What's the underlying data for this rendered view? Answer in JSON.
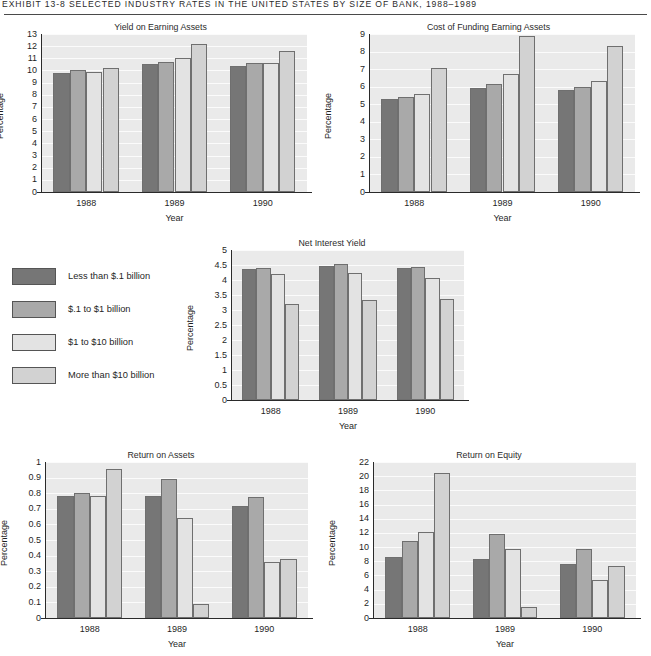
{
  "exhibit": {
    "header": "EXHIBIT 13-8   SELECTED INDUSTRY RATES IN THE UNITED STATES BY SIZE OF BANK, 1988–1989"
  },
  "legend": {
    "name": "bank-size-legend",
    "items": [
      {
        "label": "Less than $.1 billion",
        "color": "#767676"
      },
      {
        "label": "$.1 to $1 billion",
        "color": "#a9a9a9"
      },
      {
        "label": "$1 to $10 billion",
        "color": "#e3e3e3"
      },
      {
        "label": "More than $10 billion",
        "color": "#d2d2d2"
      }
    ]
  },
  "series_colors": [
    "#767676",
    "#a9a9a9",
    "#e3e3e3",
    "#d2d2d2"
  ],
  "chart_data": [
    {
      "id": "yield-on-earning-assets",
      "type": "bar",
      "title": "Yield on Earning Assets",
      "xlabel": "Year",
      "ylabel": "Percentage",
      "categories": [
        "1988",
        "1989",
        "1990"
      ],
      "ylim": [
        0,
        13
      ],
      "yticks": [
        0,
        1,
        2,
        3,
        4,
        5,
        6,
        7,
        8,
        9,
        10,
        11,
        12,
        13
      ],
      "ytick_labels": [
        "0",
        "1",
        "2",
        "3",
        "4",
        "5",
        "6",
        "7",
        "8",
        "9",
        "10",
        "11",
        "12",
        "13"
      ],
      "grid": true,
      "legend_position": "external-left-middle",
      "series": [
        {
          "name": "Less than $.1 billion",
          "values": [
            9.8,
            10.5,
            10.4
          ]
        },
        {
          "name": "$.1 to $1 billion",
          "values": [
            10.0,
            10.7,
            10.6
          ]
        },
        {
          "name": "$1 to $10 billion",
          "values": [
            9.9,
            11.0,
            10.6
          ]
        },
        {
          "name": "More than $10 billion",
          "values": [
            10.2,
            12.2,
            11.6
          ]
        }
      ]
    },
    {
      "id": "cost-of-funding-earning-assets",
      "type": "bar",
      "title": "Cost of Funding Earning Assets",
      "xlabel": "Year",
      "ylabel": "Percentage",
      "categories": [
        "1988",
        "1989",
        "1990"
      ],
      "ylim": [
        0,
        9
      ],
      "yticks": [
        0,
        1,
        2,
        3,
        4,
        5,
        6,
        7,
        8,
        9
      ],
      "ytick_labels": [
        "0",
        "1",
        "2",
        "3",
        "4",
        "5",
        "6",
        "7",
        "8",
        "9"
      ],
      "grid": true,
      "series": [
        {
          "name": "Less than $.1 billion",
          "values": [
            5.3,
            5.95,
            5.8
          ]
        },
        {
          "name": "$.1 to $1 billion",
          "values": [
            5.4,
            6.15,
            6.0
          ]
        },
        {
          "name": "$1 to $10 billion",
          "values": [
            5.6,
            6.7,
            6.35
          ]
        },
        {
          "name": "More than $10 billion",
          "values": [
            7.05,
            8.9,
            8.3
          ]
        }
      ]
    },
    {
      "id": "net-interest-yield",
      "type": "bar",
      "title": "Net Interest Yield",
      "xlabel": "Year",
      "ylabel": "Percentage",
      "categories": [
        "1988",
        "1989",
        "1990"
      ],
      "ylim": [
        0,
        5
      ],
      "yticks": [
        0,
        0.5,
        1,
        1.5,
        2,
        2.5,
        3,
        3.5,
        4,
        4.5,
        5
      ],
      "ytick_labels": [
        "0",
        "0.5",
        "1",
        "1.5",
        "2",
        "2.5",
        "3",
        "3.5",
        "4",
        "4.5",
        "5"
      ],
      "grid": true,
      "series": [
        {
          "name": "Less than $.1 billion",
          "values": [
            4.38,
            4.47,
            4.4
          ]
        },
        {
          "name": "$.1 to $1 billion",
          "values": [
            4.4,
            4.55,
            4.45
          ]
        },
        {
          "name": "$1 to $10 billion",
          "values": [
            4.2,
            4.25,
            4.08
          ]
        },
        {
          "name": "More than $10 billion",
          "values": [
            3.2,
            3.35,
            3.37
          ]
        }
      ]
    },
    {
      "id": "return-on-assets",
      "type": "bar",
      "title": "Return on Assets",
      "xlabel": "Year",
      "ylabel": "Percentage",
      "categories": [
        "1988",
        "1989",
        "1990"
      ],
      "ylim": [
        0,
        1
      ],
      "yticks": [
        0,
        0.1,
        0.2,
        0.3,
        0.4,
        0.5,
        0.6,
        0.7,
        0.8,
        0.9,
        1
      ],
      "ytick_labels": [
        "0",
        "0.1",
        "0.2",
        "0.3",
        "0.4",
        "0.5",
        "0.6",
        "0.7",
        "0.8",
        "0.9",
        "1"
      ],
      "grid": true,
      "series": [
        {
          "name": "Less than $.1 billion",
          "values": [
            0.78,
            0.78,
            0.715
          ]
        },
        {
          "name": "$.1 to $1 billion",
          "values": [
            0.8,
            0.89,
            0.775
          ]
        },
        {
          "name": "$1 to $10 billion",
          "values": [
            0.78,
            0.64,
            0.36
          ]
        },
        {
          "name": "More than $10 billion",
          "values": [
            0.955,
            0.09,
            0.38
          ]
        }
      ]
    },
    {
      "id": "return-on-equity",
      "type": "bar",
      "title": "Return on Equity",
      "xlabel": "Year",
      "ylabel": "Percentage",
      "categories": [
        "1988",
        "1989",
        "1990"
      ],
      "ylim": [
        0,
        22
      ],
      "yticks": [
        0,
        2,
        4,
        6,
        8,
        10,
        12,
        14,
        16,
        18,
        20,
        22
      ],
      "ytick_labels": [
        "0",
        "2",
        "4",
        "6",
        "8",
        "10",
        "12",
        "14",
        "16",
        "18",
        "20",
        "22"
      ],
      "grid": true,
      "series": [
        {
          "name": "Less than $.1 billion",
          "values": [
            8.6,
            8.3,
            7.6
          ]
        },
        {
          "name": "$.1 to $1 billion",
          "values": [
            10.8,
            11.8,
            9.7
          ]
        },
        {
          "name": "$1 to $10 billion",
          "values": [
            12.2,
            9.75,
            5.3
          ]
        },
        {
          "name": "More than $10 billion",
          "values": [
            20.4,
            1.6,
            7.35
          ]
        }
      ]
    }
  ],
  "layout": {
    "charts": [
      {
        "id": "yield-on-earning-assets",
        "left": 2,
        "top": 22,
        "plotLeft": 40,
        "plotTop": 12,
        "plotW": 265,
        "plotH": 158
      },
      {
        "id": "cost-of-funding-earning-assets",
        "left": 330,
        "top": 22,
        "plotLeft": 40,
        "plotTop": 12,
        "plotW": 265,
        "plotH": 158
      },
      {
        "id": "net-interest-yield",
        "left": 188,
        "top": 238,
        "plotLeft": 44,
        "plotTop": 12,
        "plotW": 232,
        "plotH": 150
      },
      {
        "id": "return-on-assets",
        "left": 2,
        "top": 450,
        "plotLeft": 44,
        "plotTop": 12,
        "plotW": 262,
        "plotH": 156
      },
      {
        "id": "return-on-equity",
        "left": 330,
        "top": 450,
        "plotLeft": 44,
        "plotTop": 12,
        "plotW": 262,
        "plotH": 156
      }
    ],
    "legend": {
      "left": 12,
      "top": 268,
      "rowGap": 33
    }
  }
}
